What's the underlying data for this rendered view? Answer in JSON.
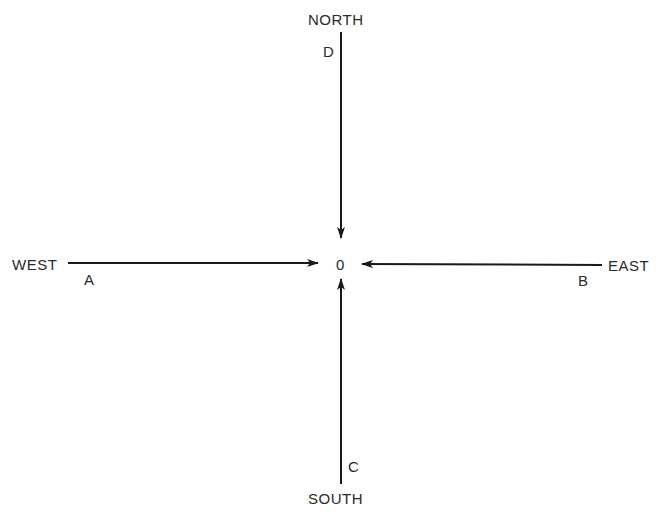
{
  "diagram": {
    "title": "",
    "directions": {
      "north": "NORTH",
      "south": "SOUTH",
      "east": "EAST",
      "west": "WEST"
    },
    "points": {
      "origin": "0",
      "a": "A",
      "b": "B",
      "c": "C",
      "d": "D"
    },
    "arrows": [
      {
        "from": "D",
        "origin_direction": "NORTH",
        "to": "0"
      },
      {
        "from": "A",
        "origin_direction": "WEST",
        "to": "0"
      },
      {
        "from": "B",
        "origin_direction": "EAST",
        "to": "0"
      },
      {
        "from": "C",
        "origin_direction": "SOUTH",
        "to": "0"
      }
    ],
    "colors": {
      "line": "#1a1a1a",
      "text": "#2a2a2a",
      "background": "#ffffff"
    }
  }
}
